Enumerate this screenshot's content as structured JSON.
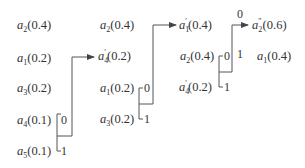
{
  "diagram": {
    "type": "huffman-coding-reduction-steps",
    "columns": [
      {
        "nodes": [
          {
            "sym": "a",
            "sub": "2",
            "prime": "",
            "prob": "(0.4)"
          },
          {
            "sym": "a",
            "sub": "1",
            "prime": "",
            "prob": "(0.2)"
          },
          {
            "sym": "a",
            "sub": "3",
            "prime": "",
            "prob": "(0.2)"
          },
          {
            "sym": "a",
            "sub": "4",
            "prime": "",
            "prob": "(0.1)"
          },
          {
            "sym": "a",
            "sub": "5",
            "prime": "",
            "prob": "(0.1)"
          }
        ]
      },
      {
        "nodes": [
          {
            "sym": "a",
            "sub": "2",
            "prime": "",
            "prob": "(0.4)"
          },
          {
            "sym": "a",
            "sub": "4",
            "prime": "′",
            "prob": "(0.2)"
          },
          {
            "sym": "a",
            "sub": "1",
            "prime": "",
            "prob": "(0.2)"
          },
          {
            "sym": "a",
            "sub": "3",
            "prime": "",
            "prob": "(0.2)"
          }
        ]
      },
      {
        "nodes": [
          {
            "sym": "a",
            "sub": "1",
            "prime": "′",
            "prob": "(0.4)"
          },
          {
            "sym": "a",
            "sub": "2",
            "prime": "",
            "prob": "(0.4)"
          },
          {
            "sym": "a",
            "sub": "4",
            "prime": "′",
            "prob": "(0.2)"
          }
        ]
      },
      {
        "nodes": [
          {
            "sym": "a",
            "sub": "2",
            "prime": "″",
            "prob": "(0.6)"
          },
          {
            "sym": "a",
            "sub": "1",
            "prime": "",
            "prob": "(0.4)"
          }
        ]
      }
    ],
    "merges": [
      {
        "from_column": 0,
        "bits": [
          "0",
          "1"
        ],
        "target": "a4′(0.2)"
      },
      {
        "from_column": 1,
        "bits": [
          "0",
          "1"
        ],
        "target": "a1′(0.4)"
      },
      {
        "from_column": 2,
        "bits": [
          "0",
          "1"
        ],
        "target": "a2″(0.6)"
      }
    ],
    "bits": {
      "zero": "0",
      "one": "1"
    }
  }
}
